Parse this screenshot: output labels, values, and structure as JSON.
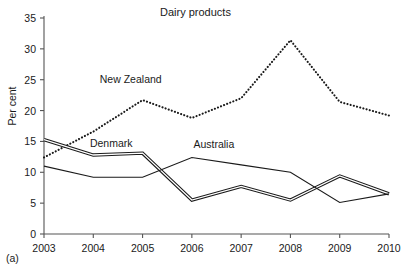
{
  "panel": {
    "tag": "(a)"
  },
  "chart_data": {
    "type": "line",
    "title": "Dairy products",
    "xlabel": "",
    "ylabel": "Per cent",
    "x": [
      2003,
      2004,
      2005,
      2006,
      2007,
      2008,
      2009,
      2010
    ],
    "xticklabels": [
      "2003",
      "2004",
      "2005",
      "2006",
      "2007",
      "2008",
      "2009",
      "2010"
    ],
    "yticks": [
      0,
      5,
      10,
      15,
      20,
      25,
      30,
      35
    ],
    "yticklabels": [
      "0",
      "5",
      "10",
      "15",
      "20",
      "25",
      "30",
      "35"
    ],
    "ylim": [
      0,
      35
    ],
    "xlim": [
      2003,
      2010
    ],
    "grid": false,
    "legend_position": "inline-annotations",
    "series": [
      {
        "name": "New Zealand",
        "style": "dotted",
        "color": "#1a1a1a",
        "values": [
          12.4,
          16.6,
          21.7,
          18.8,
          22.0,
          31.4,
          21.4,
          19.2
        ],
        "label_x": 2004.7,
        "label_y": 25.0
      },
      {
        "name": "Denmark",
        "style": "double-solid",
        "color": "#1a1a1a",
        "values": [
          15.3,
          12.8,
          13.1,
          5.5,
          7.7,
          5.5,
          9.4,
          6.5
        ],
        "label_x": 2004.5,
        "label_y": 14.6
      },
      {
        "name": "Australia",
        "style": "solid",
        "color": "#1a1a1a",
        "values": [
          11.0,
          9.2,
          9.2,
          12.4,
          11.2,
          10.0,
          5.1,
          6.5
        ],
        "label_x": 2006.6,
        "label_y": 14.4
      }
    ]
  }
}
